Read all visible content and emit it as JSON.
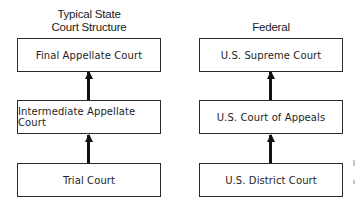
{
  "diagram": {
    "columns": [
      {
        "id": "state",
        "heading_lines": [
          "Typical State",
          "Court Structure"
        ],
        "levels": [
          {
            "label": "Final Appellate Court"
          },
          {
            "label": "Intermediate Appellate Court"
          },
          {
            "label": "Trial Court"
          }
        ]
      },
      {
        "id": "federal",
        "heading_lines": [
          "Federal"
        ],
        "levels": [
          {
            "label": "U.S. Supreme Court"
          },
          {
            "label": "U.S. Court of Appeals"
          },
          {
            "label": "U.S. District Court"
          }
        ]
      }
    ],
    "edges": [
      {
        "from": "Intermediate Appellate Court",
        "to": "Final Appellate Court",
        "type": "arrow"
      },
      {
        "from": "Trial Court",
        "to": "Intermediate Appellate Court",
        "type": "arrow"
      },
      {
        "from": "U.S. Court of Appeals",
        "to": "U.S. Supreme Court",
        "type": "arrow"
      },
      {
        "from": "U.S. District Court",
        "to": "U.S. Court of Appeals",
        "type": "arrow"
      }
    ]
  }
}
